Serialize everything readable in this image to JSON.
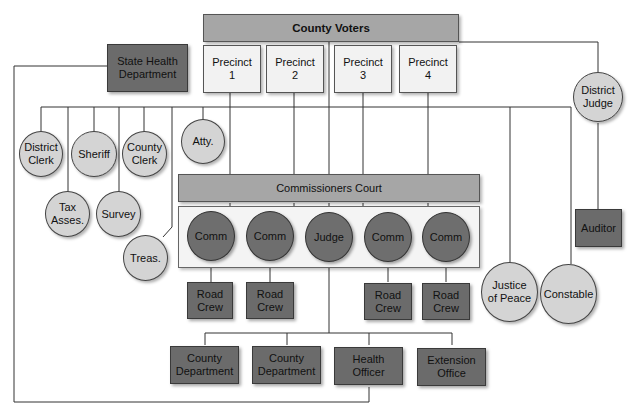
{
  "diagram": {
    "type": "organization-chart",
    "top": {
      "county_voters": "County Voters"
    },
    "precincts": [
      "Precinct\n1",
      "Precinct\n2",
      "Precinct\n3",
      "Precinct\n4"
    ],
    "state_health": "State Health\nDepartment",
    "district_judge": "District\nJudge",
    "elected_officials_row1": [
      "District\nClerk",
      "Sheriff",
      "County\nClerk",
      "Atty."
    ],
    "elected_officials_row2": [
      "Tax\nAsses.",
      "Survey"
    ],
    "treasurer": "Treas.",
    "commissioners_court": {
      "title": "Commissioners Court",
      "members": [
        "Comm",
        "Comm",
        "Judge",
        "Comm",
        "Comm"
      ]
    },
    "road_crews": [
      "Road\nCrew",
      "Road\nCrew",
      "Road\nCrew",
      "Road\nCrew"
    ],
    "justice_of_peace": "Justice\nof Peace",
    "constable": "Constable",
    "auditor": "Auditor",
    "departments": [
      "County\nDepartment",
      "County\nDepartment",
      "Health\nOfficer",
      "Extension\nOffice"
    ]
  },
  "colors": {
    "dark_box": "#6b6b6b",
    "light_box": "#f2f2f2",
    "mid_bar": "#a6a6a6",
    "light_circle": "#d4d4d4",
    "dark_circle": "#6e6e6e",
    "line": "#333333"
  }
}
